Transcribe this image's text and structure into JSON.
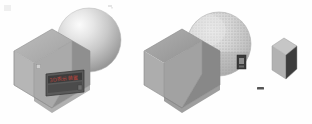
{
  "image": {
    "title": "3D rendering comparison — cube and sphere pair",
    "background_color": "#fefefe",
    "width": 312,
    "height": 124
  },
  "scenes": [
    {
      "id": "scene-left",
      "name": "Smooth shaded scene",
      "objects": [
        {
          "name": "cube",
          "label": "beveled-cube",
          "face_colors": {
            "top_left": "#a8a8a8",
            "top_right": "#9b9b9b",
            "left": "#b2b2b2",
            "right": "#8e8e8e",
            "front_shadow": "#6d6d6d"
          }
        },
        {
          "name": "sphere",
          "label": "smooth-sphere",
          "shading": "gouraud",
          "colors": {
            "highlight": "#f2f2f2",
            "mid": "#c9c9c9",
            "shadow": "#9a9a9a"
          }
        },
        {
          "name": "label-plate",
          "label": "info-plate",
          "plate_color": "#4e4e4e",
          "border_color": "#2f2f2f",
          "text": "3D表示装置",
          "text_color": "#b8443c"
        }
      ]
    },
    {
      "id": "scene-right",
      "name": "Dithered / stippled scene",
      "objects": [
        {
          "name": "cube",
          "label": "beveled-cube",
          "face_colors": {
            "top_left": "#9f9f9f",
            "top_right": "#949494",
            "left": "#acacac",
            "right": "#868686",
            "front_shadow": "#5c5c5c"
          }
        },
        {
          "name": "sphere",
          "label": "stippled-sphere",
          "shading": "dithered",
          "colors": {
            "base": "#d2d2d2",
            "dot": "#8a8a8a",
            "rim": "#aaaaaa"
          }
        },
        {
          "name": "marker",
          "label": "dark-marker-chip",
          "color": "#3a3a3a"
        },
        {
          "name": "small-box",
          "label": "small-beveled-box",
          "face_colors": {
            "top": "#c6c6c6",
            "left": "#b0b0b0",
            "right": "#3d3d3d",
            "front": "#7d7d7d"
          }
        },
        {
          "name": "dash",
          "label": "small-dash-mark",
          "color": "#555555"
        }
      ]
    }
  ],
  "artifacts": [
    {
      "name": "speck-top-left",
      "color": "#dcdcdc"
    },
    {
      "name": "speck-top-center",
      "color": "#c0c0c0"
    }
  ]
}
